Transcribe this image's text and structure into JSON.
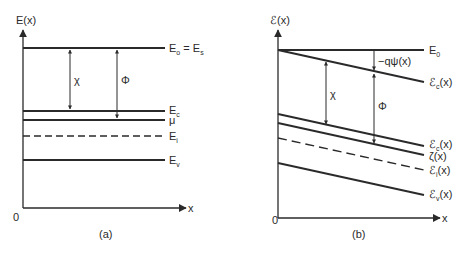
{
  "panel_a": {
    "caption": "(a)",
    "y_axis_label": "E(x)",
    "x_axis_label": "x",
    "origin_label": "0",
    "levels": [
      {
        "main": "E",
        "sub": "o",
        "suffix": " = E",
        "suffix_sub": "s",
        "style": "solid"
      },
      {
        "main": "E",
        "sub": "c",
        "style": "solid"
      },
      {
        "main": "μ",
        "sub": "",
        "style": "solid"
      },
      {
        "main": "E",
        "sub": "i",
        "style": "dashed"
      },
      {
        "main": "E",
        "sub": "v",
        "style": "solid"
      }
    ],
    "arrows": [
      {
        "symbol": "χ",
        "from": "E_o",
        "to": "E_c"
      },
      {
        "symbol": "Φ",
        "from": "E_o",
        "to": "μ"
      }
    ]
  },
  "panel_b": {
    "caption": "(b)",
    "y_axis_label": "ℰ(x)",
    "x_axis_label": "x",
    "origin_label": "0",
    "levels": [
      {
        "main": "E",
        "sub": "0",
        "suffix": "",
        "style": "solid"
      },
      {
        "main": "ℰ",
        "sub": "c",
        "suffix": "(x)",
        "style": "solid",
        "note": "upper sloped line"
      },
      {
        "main": "ℰ",
        "sub": "c",
        "suffix": "(x)",
        "style": "solid"
      },
      {
        "main": "ζ",
        "sub": "",
        "suffix": "(x)",
        "style": "solid"
      },
      {
        "main": "ℰ",
        "sub": "i",
        "suffix": "(x)",
        "style": "dashed"
      },
      {
        "main": "ℰ",
        "sub": "v",
        "suffix": "(x)",
        "style": "solid"
      }
    ],
    "arrows": [
      {
        "symbol": "χ",
        "from": "upper sloped line",
        "to": "ℰ_c(x)"
      },
      {
        "symbol": "Φ",
        "from": "upper sloped line",
        "to": "ζ(x)"
      },
      {
        "symbol": "−qψ(x)",
        "from": "E_0",
        "to": "upper sloped line"
      }
    ]
  }
}
